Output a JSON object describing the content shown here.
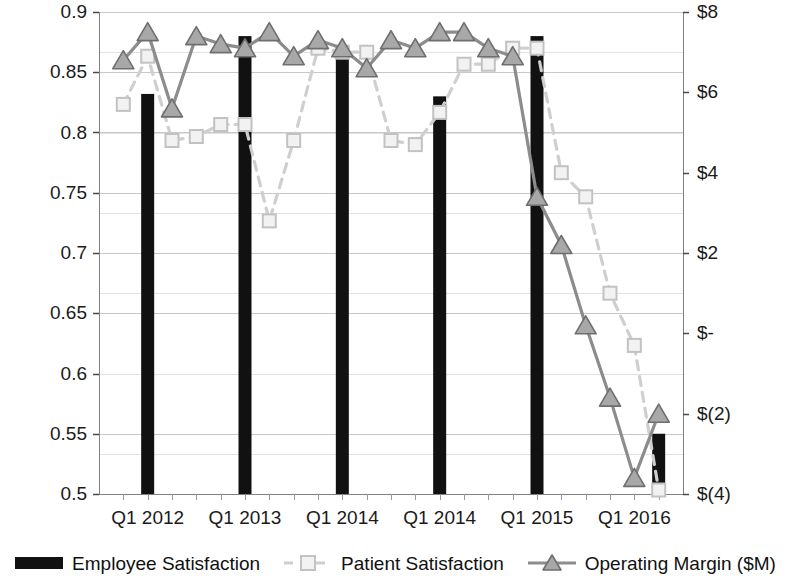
{
  "chart_data": {
    "type": "bar",
    "title": "",
    "xlabel": "",
    "ylabel": "",
    "grid": true,
    "legend_position": "bottom",
    "categories": [
      "Q1 2012",
      "Q2 2012",
      "Q3 2012",
      "Q4 2012",
      "Q1 2013",
      "Q2 2013",
      "Q3 2013",
      "Q4 2013",
      "Q1 2014",
      "Q2 2014",
      "Q3 2014",
      "Q4 2014",
      "Q1 2014b",
      "Q2 2014b",
      "Q3 2014b",
      "Q4 2014b",
      "Q1 2015",
      "Q2 2015",
      "Q3 2015",
      "Q4 2015",
      "Q1 2016",
      "Q2 2016",
      "Q3 2016"
    ],
    "x_tick_labels": [
      "Q1 2012",
      "Q1 2013",
      "Q1 2014",
      "Q1 2014",
      "Q1 2015",
      "Q1 2016"
    ],
    "x_tick_indices": [
      1,
      5,
      9,
      13,
      17,
      21
    ],
    "y_left_axis": {
      "label": "",
      "min": 0.5,
      "max": 0.9,
      "step": 0.05,
      "ticks": [
        "0.9",
        "0.85",
        "0.8",
        "0.75",
        "0.7",
        "0.65",
        "0.6",
        "0.55",
        "0.5"
      ],
      "tick_values": [
        0.9,
        0.85,
        0.8,
        0.75,
        0.7,
        0.65,
        0.6,
        0.55,
        0.5
      ]
    },
    "y_right_axis": {
      "label": "",
      "min": -4,
      "max": 8,
      "step": 2,
      "ticks": [
        "$8",
        "$6",
        "$4",
        "$2",
        "$-",
        "$(2)",
        "$(4)"
      ],
      "tick_values": [
        8,
        6,
        4,
        2,
        0,
        -2,
        -4
      ]
    },
    "series": [
      {
        "name": "Employee Satisfaction",
        "type": "bar",
        "axis": "left",
        "color": "#111111",
        "points": [
          {
            "index": 1,
            "value": 0.832
          },
          {
            "index": 5,
            "value": 0.88
          },
          {
            "index": 9,
            "value": 0.862
          },
          {
            "index": 13,
            "value": 0.83
          },
          {
            "index": 17,
            "value": 0.88
          },
          {
            "index": 22,
            "value": 0.55
          }
        ]
      },
      {
        "name": "Patient Satisfaction",
        "type": "line",
        "axis": "right",
        "color": "#cfcfcf",
        "dash": "dashed",
        "marker": "square",
        "values": [
          5.7,
          6.9,
          4.8,
          4.9,
          5.2,
          5.2,
          2.8,
          4.8,
          7.1,
          7.0,
          7.0,
          4.8,
          4.7,
          5.5,
          6.7,
          6.7,
          7.1,
          7.1,
          4.0,
          3.4,
          1.0,
          -0.3,
          -3.9
        ]
      },
      {
        "name": "Operating Margin ($M)",
        "type": "line",
        "axis": "right",
        "color": "#8c8c8c",
        "dash": "solid",
        "marker": "triangle",
        "values": [
          6.8,
          7.5,
          5.6,
          7.4,
          7.2,
          7.1,
          7.5,
          6.9,
          7.3,
          7.1,
          6.6,
          7.3,
          7.1,
          7.5,
          7.5,
          7.1,
          6.9,
          3.4,
          2.2,
          0.2,
          -1.6,
          -3.6,
          -2.0
        ]
      }
    ]
  },
  "legend": {
    "items": [
      {
        "label": "Employee Satisfaction",
        "marker": "bar-swatch",
        "color": "#111111"
      },
      {
        "label": "Patient Satisfaction",
        "marker": "square-marker",
        "color": "#cfcfcf"
      },
      {
        "label": "Operating Margin ($M)",
        "marker": "triangle-marker",
        "color": "#8c8c8c"
      }
    ]
  },
  "plot_geometry": {
    "left": 99,
    "right": 683,
    "top": 12,
    "bottom": 494
  }
}
